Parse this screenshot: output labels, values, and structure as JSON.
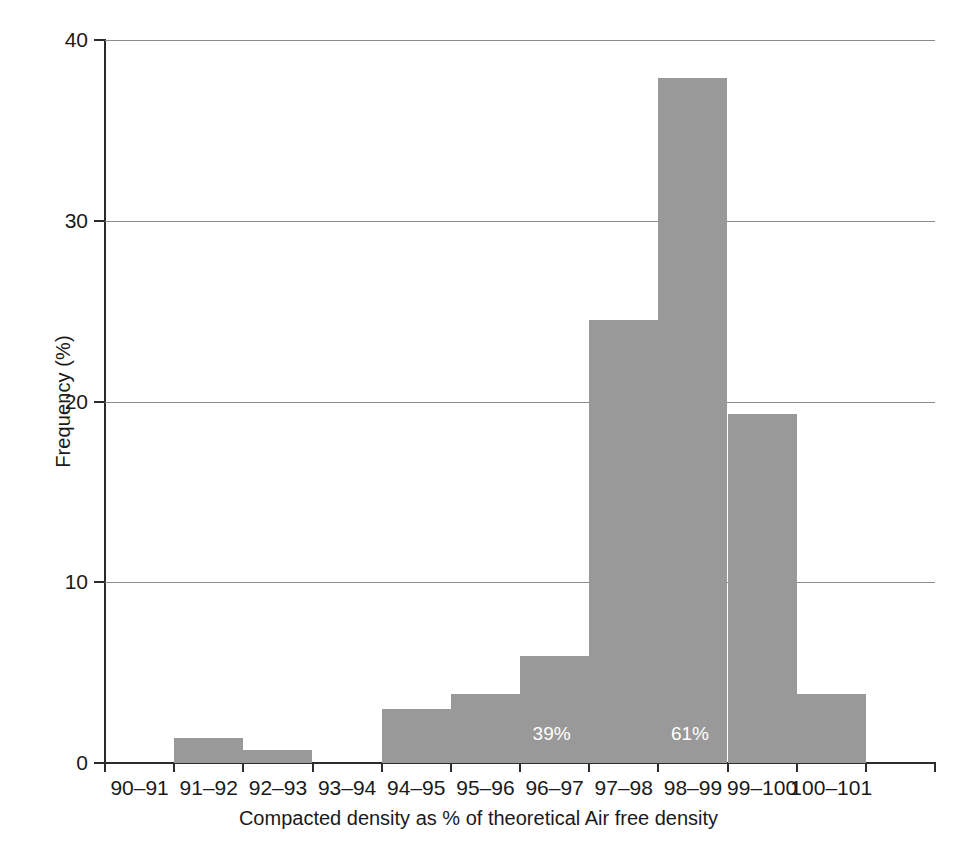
{
  "chart_data": {
    "type": "bar",
    "title": "",
    "xlabel": "Compacted density as % of theoretical Air free density",
    "ylabel": "Frequency (%)",
    "categories": [
      "90–91",
      "91–92",
      "92–93",
      "93–94",
      "94–95",
      "95–96",
      "96–97",
      "97–98",
      "98–99",
      "99–100",
      "100–101"
    ],
    "values": [
      0,
      1.4,
      0.7,
      0,
      3.0,
      3.8,
      5.9,
      24.5,
      37.9,
      19.3,
      3.8
    ],
    "ylim": [
      0,
      40
    ],
    "yticks": [
      0,
      10,
      20,
      30,
      40
    ],
    "ytick_labels": [
      "0",
      "10",
      "20",
      "30",
      "40"
    ],
    "grid": "horizontal",
    "legend": "none",
    "bar_color": "#999999",
    "annotations": [
      {
        "text": "39%",
        "bin": "96–97",
        "value_y": 1.6
      },
      {
        "text": "61%",
        "bin": "98–99",
        "value_y": 1.6
      }
    ]
  }
}
